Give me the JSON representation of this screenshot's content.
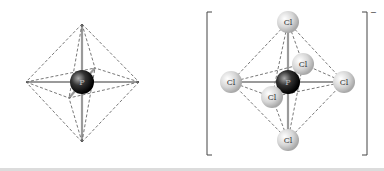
{
  "diagram": {
    "left": {
      "description": "Octahedral geometry of P center with bonds and dashed octahedron",
      "central_atom": "P"
    },
    "right": {
      "description": "PCl6- ion in octahedral geometry",
      "central_atom": "P",
      "ligands": [
        "Cl",
        "Cl",
        "Cl",
        "Cl",
        "Cl",
        "Cl"
      ],
      "charge": "−"
    }
  },
  "colors": {
    "dashed": "#555555",
    "bond": "#9a9a9a",
    "cl_sphere": "#d8d8d8",
    "p_sphere": "#222222"
  }
}
